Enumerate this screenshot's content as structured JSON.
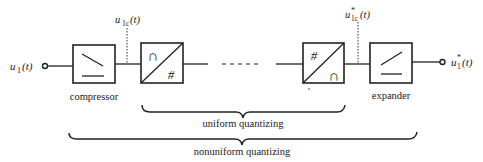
{
  "diagram": {
    "input_signal": {
      "base": "u",
      "sub": "1",
      "arg": "(t)"
    },
    "compressed_signal": {
      "base": "u",
      "sub": "1c",
      "arg": "(t)"
    },
    "quantized_compressed_signal": {
      "base": "u",
      "sup": "*",
      "sub": "1c",
      "arg": "(t)"
    },
    "output_signal": {
      "base": "u",
      "sup": "*",
      "sub": "1",
      "arg": "(t)"
    },
    "blocks": [
      {
        "id": "compressor",
        "label": "compressor",
        "icon": "compressor-characteristic-icon"
      },
      {
        "id": "adc",
        "label": "",
        "icon": "analog-to-digital-icon",
        "top_symbol": "∩",
        "bottom_symbol": "#"
      },
      {
        "id": "dac",
        "label": "",
        "icon": "digital-to-analog-icon",
        "top_symbol": "#",
        "bottom_symbol": "∩"
      },
      {
        "id": "expander",
        "label": "expander",
        "icon": "expander-characteristic-icon"
      }
    ],
    "braces": [
      {
        "label": "uniform quantizing"
      },
      {
        "label": "nonuniform quantizing"
      }
    ],
    "colors": {
      "stroke": "#222222",
      "background": "#ffffff"
    }
  }
}
